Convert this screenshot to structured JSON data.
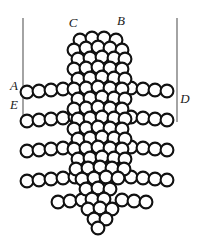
{
  "figure": {
    "background_color": "#ffffff",
    "sphere_fill": "#ffffff",
    "sphere_stroke": "#111111",
    "reference_line_color": "#8d8d8d",
    "label_color": "#1a1a1a"
  },
  "labels": [
    {
      "id": "label-A",
      "text": "A",
      "x": 14,
      "y": 87
    },
    {
      "id": "label-B",
      "text": "B",
      "x": 121,
      "y": 22
    },
    {
      "id": "label-C",
      "text": "C",
      "x": 73,
      "y": 24
    },
    {
      "id": "label-D",
      "text": "D",
      "x": 185,
      "y": 100
    },
    {
      "id": "label-E",
      "text": "E",
      "x": 14,
      "y": 106
    }
  ],
  "reference_lines": [
    {
      "id": "left-reference-line",
      "x1": 23,
      "y1": 18,
      "x2": 23,
      "y2": 122
    },
    {
      "id": "right-reference-line",
      "x1": 177,
      "y1": 18,
      "x2": 177,
      "y2": 122
    }
  ],
  "chart_data": {
    "type": "scatter",
    "xlabel": "",
    "ylabel": "",
    "xlim": [
      0,
      206
    ],
    "ylim": [
      0,
      244
    ],
    "grid": false,
    "legend_position": "none",
    "sphere_radius": 6.4,
    "series": [
      {
        "name": "column-spheres",
        "description": "Central vertical lattice column of overlapping spheres",
        "points": [
          [
            80,
            40
          ],
          [
            92,
            38
          ],
          [
            104,
            38
          ],
          [
            116,
            40
          ],
          [
            74,
            50
          ],
          [
            86,
            48
          ],
          [
            98,
            47
          ],
          [
            110,
            48
          ],
          [
            122,
            50
          ],
          [
            78,
            59
          ],
          [
            90,
            58
          ],
          [
            102,
            57
          ],
          [
            114,
            58
          ],
          [
            125,
            59
          ],
          [
            74,
            69
          ],
          [
            86,
            68
          ],
          [
            98,
            67
          ],
          [
            110,
            68
          ],
          [
            122,
            69
          ],
          [
            78,
            79
          ],
          [
            90,
            78
          ],
          [
            102,
            77
          ],
          [
            114,
            78
          ],
          [
            125,
            79
          ],
          [
            74,
            89
          ],
          [
            86,
            88
          ],
          [
            98,
            87
          ],
          [
            110,
            88
          ],
          [
            122,
            89
          ],
          [
            78,
            99
          ],
          [
            90,
            98
          ],
          [
            102,
            97
          ],
          [
            114,
            98
          ],
          [
            125,
            99
          ],
          [
            74,
            109
          ],
          [
            86,
            108
          ],
          [
            98,
            107
          ],
          [
            110,
            108
          ],
          [
            122,
            109
          ],
          [
            78,
            119
          ],
          [
            90,
            118
          ],
          [
            102,
            117
          ],
          [
            114,
            118
          ],
          [
            125,
            119
          ],
          [
            74,
            129
          ],
          [
            86,
            128
          ],
          [
            98,
            127
          ],
          [
            110,
            128
          ],
          [
            122,
            129
          ],
          [
            78,
            139
          ],
          [
            90,
            138
          ],
          [
            102,
            137
          ],
          [
            114,
            138
          ],
          [
            125,
            139
          ],
          [
            74,
            149
          ],
          [
            86,
            148
          ],
          [
            98,
            147
          ],
          [
            110,
            148
          ],
          [
            122,
            149
          ],
          [
            78,
            159
          ],
          [
            90,
            158
          ],
          [
            102,
            157
          ],
          [
            114,
            158
          ],
          [
            125,
            159
          ],
          [
            76,
            169
          ],
          [
            88,
            168
          ],
          [
            100,
            167
          ],
          [
            112,
            168
          ],
          [
            124,
            169
          ],
          [
            82,
            179
          ],
          [
            94,
            178
          ],
          [
            106,
            177
          ],
          [
            118,
            178
          ],
          [
            86,
            189
          ],
          [
            98,
            188
          ],
          [
            110,
            189
          ],
          [
            92,
            199
          ],
          [
            104,
            199
          ],
          [
            88,
            209
          ],
          [
            100,
            208
          ],
          [
            112,
            209
          ],
          [
            94,
            219
          ],
          [
            106,
            219
          ],
          [
            98,
            228
          ]
        ]
      },
      {
        "name": "chain-A",
        "description": "Horizontal sphere chain at level A extending from left reference line through the column",
        "y": 89,
        "points": [
          [
            27,
            92
          ],
          [
            39,
            91
          ],
          [
            51,
            90
          ],
          [
            63,
            89
          ],
          [
            75,
            88
          ],
          [
            131,
            88
          ],
          [
            143,
            89
          ],
          [
            155,
            90
          ],
          [
            167,
            91
          ]
        ]
      },
      {
        "name": "chain-E",
        "description": "Horizontal sphere chain at level E",
        "y": 118,
        "points": [
          [
            27,
            121
          ],
          [
            39,
            120
          ],
          [
            51,
            119
          ],
          [
            63,
            118
          ],
          [
            75,
            117
          ],
          [
            131,
            117
          ],
          [
            143,
            118
          ],
          [
            155,
            119
          ],
          [
            167,
            120
          ]
        ]
      },
      {
        "name": "chain-3",
        "description": "Third horizontal sphere chain",
        "y": 148,
        "points": [
          [
            27,
            151
          ],
          [
            39,
            150
          ],
          [
            51,
            149
          ],
          [
            63,
            148
          ],
          [
            75,
            147
          ],
          [
            131,
            147
          ],
          [
            143,
            148
          ],
          [
            155,
            149
          ],
          [
            167,
            150
          ]
        ]
      },
      {
        "name": "chain-4",
        "description": "Fourth horizontal sphere chain",
        "y": 178,
        "points": [
          [
            27,
            181
          ],
          [
            39,
            180
          ],
          [
            51,
            179
          ],
          [
            63,
            178
          ],
          [
            75,
            177
          ],
          [
            131,
            177
          ],
          [
            143,
            178
          ],
          [
            155,
            179
          ],
          [
            167,
            180
          ]
        ]
      },
      {
        "name": "chain-5",
        "description": "Short lower horizontal sphere chain",
        "y": 200,
        "points": [
          [
            58,
            202
          ],
          [
            70,
            201
          ],
          [
            82,
            200
          ],
          [
            122,
            200
          ],
          [
            134,
            201
          ],
          [
            146,
            202
          ]
        ]
      }
    ]
  }
}
